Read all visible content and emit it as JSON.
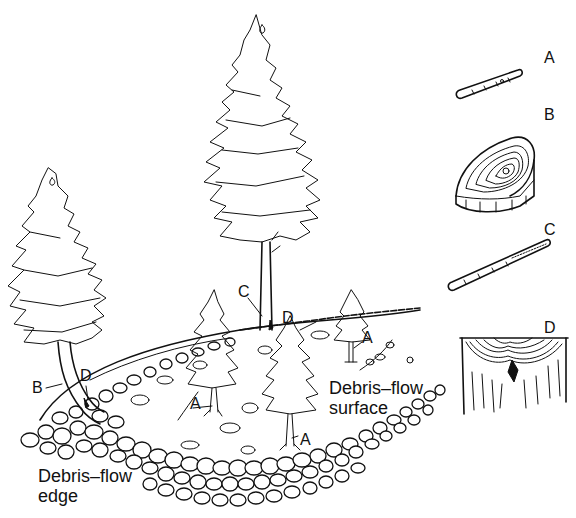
{
  "figure": {
    "type": "diagram",
    "scene_labels": {
      "tree_left_B": "B",
      "tree_left_D": "D",
      "tree_tall_C": "C",
      "tree_tall_D": "D",
      "tree_right_A": "A",
      "tree_mid_left_A": "A",
      "tree_mid_right_A": "A"
    },
    "captions": {
      "surface_line1": "Debris–flow",
      "surface_line2": "surface",
      "edge_line1": "Debris–flow",
      "edge_line2": "edge"
    },
    "legend": [
      {
        "key": "A",
        "icon": "tilted-core-icon"
      },
      {
        "key": "B",
        "icon": "eccentric-ring-disk-icon"
      },
      {
        "key": "C",
        "icon": "suppressed-growth-core-icon"
      },
      {
        "key": "D",
        "icon": "scar-callus-section-icon"
      }
    ]
  }
}
